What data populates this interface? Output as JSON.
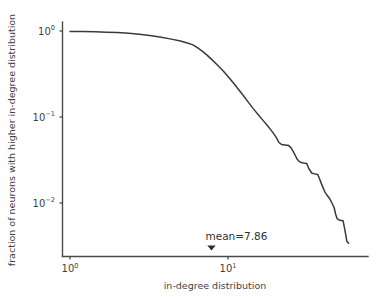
{
  "chart_data": {
    "type": "line",
    "title": "",
    "xlabel": "in-degree distribution",
    "ylabel": "fraction of neurons with higher in-degree distribution",
    "xscale": "log",
    "yscale": "log",
    "xlim": [
      1.0,
      60.0
    ],
    "ylim": [
      0.0025,
      1.15
    ],
    "grid": false,
    "legend": null,
    "xticks": [
      1,
      10
    ],
    "xticklabels": [
      "10^0",
      "10^1"
    ],
    "yticks": [
      1,
      0.1,
      0.01
    ],
    "yticklabels": [
      "10^0",
      "10^-1",
      "10^-2"
    ],
    "annotations": [
      {
        "name": "mean-annotation",
        "text": "mean=7.86",
        "x": 7.86,
        "y": 0.0045,
        "marker": "down-triangle"
      }
    ],
    "series": [
      {
        "name": "ccdf",
        "color": "#3a3a3a",
        "points": [
          [
            1.0,
            0.99
          ],
          [
            1.2,
            0.984
          ],
          [
            1.45,
            0.978
          ],
          [
            1.7,
            0.97
          ],
          [
            2.0,
            0.958
          ],
          [
            2.35,
            0.94
          ],
          [
            2.75,
            0.915
          ],
          [
            3.2,
            0.885
          ],
          [
            3.7,
            0.85
          ],
          [
            4.3,
            0.81
          ],
          [
            5.0,
            0.765
          ],
          [
            5.6,
            0.72
          ],
          [
            6.0,
            0.69
          ],
          [
            6.4,
            0.64
          ],
          [
            6.9,
            0.58
          ],
          [
            7.4,
            0.52
          ],
          [
            8.0,
            0.455
          ],
          [
            8.6,
            0.4
          ],
          [
            9.3,
            0.345
          ],
          [
            10.0,
            0.295
          ],
          [
            10.8,
            0.25
          ],
          [
            11.6,
            0.212
          ],
          [
            12.5,
            0.178
          ],
          [
            13.4,
            0.15
          ],
          [
            14.4,
            0.126
          ],
          [
            15.5,
            0.107
          ],
          [
            16.6,
            0.092
          ],
          [
            17.8,
            0.079
          ],
          [
            19.0,
            0.068
          ],
          [
            20.2,
            0.058
          ],
          [
            21.0,
            0.0505
          ],
          [
            21.8,
            0.048
          ],
          [
            23.0,
            0.0472
          ],
          [
            24.2,
            0.0465
          ],
          [
            25.0,
            0.044
          ],
          [
            25.8,
            0.04
          ],
          [
            26.6,
            0.036
          ],
          [
            27.5,
            0.032
          ],
          [
            28.5,
            0.03
          ],
          [
            30.0,
            0.0292
          ],
          [
            31.5,
            0.0288
          ],
          [
            32.5,
            0.025
          ],
          [
            34.0,
            0.0222
          ],
          [
            35.5,
            0.0218
          ],
          [
            37.0,
            0.0215
          ],
          [
            38.0,
            0.019
          ],
          [
            39.0,
            0.0168
          ],
          [
            40.0,
            0.015
          ],
          [
            41.0,
            0.0135
          ],
          [
            42.5,
            0.0122
          ],
          [
            44.0,
            0.0112
          ],
          [
            45.5,
            0.01
          ],
          [
            47.0,
            0.0088
          ],
          [
            48.0,
            0.0074
          ],
          [
            49.0,
            0.0066
          ],
          [
            51.0,
            0.0063
          ],
          [
            53.5,
            0.0062
          ],
          [
            55.0,
            0.0048
          ],
          [
            56.5,
            0.0036
          ],
          [
            58.0,
            0.0034
          ]
        ]
      }
    ]
  },
  "axes": {
    "x_tick_0_base": "10",
    "x_tick_0_exp": "0",
    "x_tick_1_base": "10",
    "x_tick_1_exp": "1",
    "y_tick_0_base": "10",
    "y_tick_0_exp": "0",
    "y_tick_1_base": "10",
    "y_tick_1_exp": "−1",
    "y_tick_2_base": "10",
    "y_tick_2_exp": "−2"
  },
  "style": {
    "curve_color": "#3a3a3a",
    "spine_color": "#4a4a4a",
    "text_color": "#3f3f3f",
    "background": "#ffffff"
  }
}
